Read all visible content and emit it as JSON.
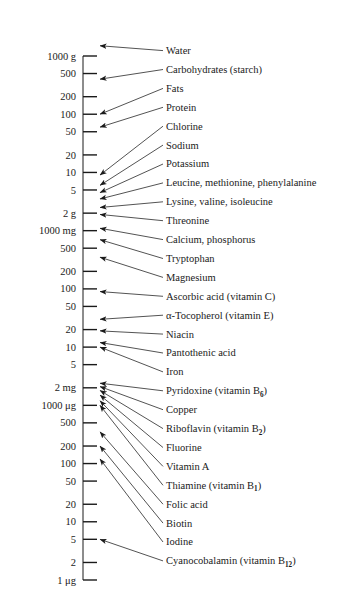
{
  "figure": {
    "axis_orientation": "vertical-log"
  },
  "chart_data": {
    "type": "scatter",
    "xlabel": "",
    "ylabel": "",
    "scale": "log",
    "grid": false,
    "legend_position": "none",
    "axis_top_value_ug": 1000000000,
    "axis_bottom_value_ug": 1,
    "tick_labels": [
      {
        "text": "1000 g",
        "value_ug": 1000000000
      },
      {
        "text": "500",
        "value_ug": 500000000
      },
      {
        "text": "200",
        "value_ug": 200000000
      },
      {
        "text": "100",
        "value_ug": 100000000
      },
      {
        "text": "50",
        "value_ug": 50000000
      },
      {
        "text": "20",
        "value_ug": 20000000
      },
      {
        "text": "10",
        "value_ug": 10000000
      },
      {
        "text": "5",
        "value_ug": 5000000
      },
      {
        "text": "2 g",
        "value_ug": 2000000
      },
      {
        "text": "1000 mg",
        "value_ug": 1000000
      },
      {
        "text": "500",
        "value_ug": 500000
      },
      {
        "text": "200",
        "value_ug": 200000
      },
      {
        "text": "100",
        "value_ug": 100000
      },
      {
        "text": "50",
        "value_ug": 50000
      },
      {
        "text": "20",
        "value_ug": 20000
      },
      {
        "text": "10",
        "value_ug": 10000
      },
      {
        "text": "5",
        "value_ug": 5000
      },
      {
        "text": "2 mg",
        "value_ug": 2000
      },
      {
        "text": "1000 μg",
        "value_ug": 1000
      },
      {
        "text": "500",
        "value_ug": 500
      },
      {
        "text": "200",
        "value_ug": 200
      },
      {
        "text": "100",
        "value_ug": 100
      },
      {
        "text": "50",
        "value_ug": 50
      },
      {
        "text": "20",
        "value_ug": 20
      },
      {
        "text": "10",
        "value_ug": 10
      },
      {
        "text": "5",
        "value_ug": 5
      },
      {
        "text": "2",
        "value_ug": 2
      },
      {
        "text": "1 μg",
        "value_ug": 1
      }
    ],
    "categories": [
      "Water",
      "Carbohydrates (starch)",
      "Fats",
      "Protein",
      "Chlorine",
      "Sodium",
      "Potassium",
      "Leucine, methionine, phenylalanine",
      "Lysine, valine, isoleucine",
      "Threonine",
      "Calcium, phosphorus",
      "Tryptophan",
      "Magnesium",
      "Ascorbic acid (vitamin C)",
      "α-Tocopherol (vitamin E)",
      "Niacin",
      "Pantothenic acid",
      "Iron",
      "Pyridoxine (vitamin B6)",
      "Copper",
      "Riboflavin (vitamin B2)",
      "Fluorine",
      "Vitamin A",
      "Thiamine (vitamin B1)",
      "Folic acid",
      "Biotin",
      "Iodine",
      "Cyanocobalamin (vitamin B12)"
    ],
    "values": [
      1500000000,
      400000000,
      100000000,
      60000000,
      9000000,
      6000000,
      4500000,
      3500000,
      2500000,
      1900000,
      1100000,
      700000,
      350000,
      90000,
      30000,
      19000,
      12000,
      10000,
      2400,
      2100,
      1800,
      1500,
      1200,
      1000,
      350,
      200,
      120,
      5
    ],
    "arrow_targets_ug": [
      1500000000,
      400000000,
      100000000,
      60000000,
      9000000,
      6000000,
      4500000,
      3500000,
      2500000,
      1900000,
      1100000,
      700000,
      350000,
      90000,
      30000,
      19000,
      12000,
      10000,
      2400,
      2100,
      1800,
      1500,
      1200,
      1000,
      350,
      200,
      120,
      5
    ]
  },
  "labels": [
    {
      "text": "Water",
      "sub": "",
      "tail": ""
    },
    {
      "text": "Carbohydrates (starch)",
      "sub": "",
      "tail": ""
    },
    {
      "text": "Fats",
      "sub": "",
      "tail": ""
    },
    {
      "text": "Protein",
      "sub": "",
      "tail": ""
    },
    {
      "text": "Chlorine",
      "sub": "",
      "tail": ""
    },
    {
      "text": "Sodium",
      "sub": "",
      "tail": ""
    },
    {
      "text": "Potassium",
      "sub": "",
      "tail": ""
    },
    {
      "text": "Leucine, methionine, phenylalanine",
      "sub": "",
      "tail": ""
    },
    {
      "text": "Lysine, valine, isoleucine",
      "sub": "",
      "tail": ""
    },
    {
      "text": "Threonine",
      "sub": "",
      "tail": ""
    },
    {
      "text": "Calcium, phosphorus",
      "sub": "",
      "tail": ""
    },
    {
      "text": "Tryptophan",
      "sub": "",
      "tail": ""
    },
    {
      "text": "Magnesium",
      "sub": "",
      "tail": ""
    },
    {
      "text": "Ascorbic acid (vitamin C)",
      "sub": "",
      "tail": ""
    },
    {
      "text": "α-Tocopherol (vitamin E)",
      "sub": "",
      "tail": ""
    },
    {
      "text": "Niacin",
      "sub": "",
      "tail": ""
    },
    {
      "text": "Pantothenic acid",
      "sub": "",
      "tail": ""
    },
    {
      "text": "Iron",
      "sub": "",
      "tail": ""
    },
    {
      "text": "Pyridoxine (vitamin B",
      "sub": "6",
      "tail": ")"
    },
    {
      "text": "Copper",
      "sub": "",
      "tail": ""
    },
    {
      "text": "Riboflavin (vitamin B",
      "sub": "2",
      "tail": ")"
    },
    {
      "text": "Fluorine",
      "sub": "",
      "tail": ""
    },
    {
      "text": "Vitamin A",
      "sub": "",
      "tail": ""
    },
    {
      "text": "Thiamine (vitamin B",
      "sub": "1",
      "tail": ")"
    },
    {
      "text": "Folic acid",
      "sub": "",
      "tail": ""
    },
    {
      "text": "Biotin",
      "sub": "",
      "tail": ""
    },
    {
      "text": "Iodine",
      "sub": "",
      "tail": ""
    },
    {
      "text": "Cyanocobalamin (vitamin B",
      "sub": "12",
      "tail": ")"
    }
  ],
  "geometry": {
    "axis_x": 83,
    "tick_major_x2": 97,
    "tick_minor_x2": 93,
    "arrow_start_x": 163,
    "label_x": 166,
    "top_y": 56,
    "bottom_y": 580,
    "label_top_y": 54,
    "label_line_height": 18.9
  },
  "colors": {
    "ink": "#1a1a1a",
    "background": "#ffffff"
  }
}
